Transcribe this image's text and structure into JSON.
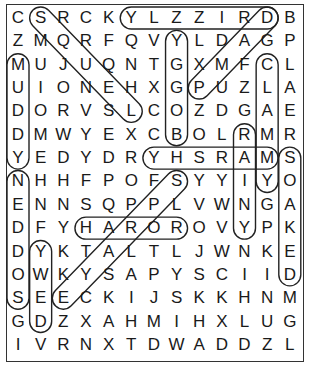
{
  "puzzle": {
    "type": "word-search",
    "rows": 15,
    "cols": 13,
    "grid": [
      [
        "C",
        "S",
        "R",
        "C",
        "K",
        "Y",
        "L",
        "Z",
        "Z",
        "I",
        "R",
        "D",
        "B"
      ],
      [
        "Z",
        "M",
        "Q",
        "R",
        "F",
        "Q",
        "V",
        "Y",
        "L",
        "D",
        "A",
        "G",
        "P"
      ],
      [
        "M",
        "U",
        "J",
        "U",
        "Q",
        "N",
        "T",
        "G",
        "X",
        "M",
        "F",
        "C",
        "L"
      ],
      [
        "U",
        "I",
        "O",
        "N",
        "E",
        "H",
        "X",
        "G",
        "P",
        "U",
        "Z",
        "L",
        "A"
      ],
      [
        "D",
        "O",
        "R",
        "V",
        "S",
        "L",
        "C",
        "O",
        "Z",
        "D",
        "G",
        "A",
        "E"
      ],
      [
        "D",
        "M",
        "W",
        "Y",
        "E",
        "X",
        "C",
        "B",
        "O",
        "L",
        "R",
        "M",
        "R"
      ],
      [
        "Y",
        "E",
        "D",
        "Y",
        "D",
        "R",
        "Y",
        "H",
        "S",
        "R",
        "A",
        "M",
        "S"
      ],
      [
        "N",
        "H",
        "H",
        "F",
        "P",
        "O",
        "F",
        "S",
        "Y",
        "Y",
        "I",
        "Y",
        "O"
      ],
      [
        "E",
        "N",
        "N",
        "S",
        "Q",
        "P",
        "P",
        "L",
        "V",
        "W",
        "N",
        "G",
        "A"
      ],
      [
        "D",
        "F",
        "Y",
        "H",
        "A",
        "R",
        "O",
        "R",
        "O",
        "V",
        "Y",
        "P",
        "K"
      ],
      [
        "D",
        "Y",
        "K",
        "T",
        "A",
        "L",
        "T",
        "L",
        "J",
        "W",
        "N",
        "K",
        "E"
      ],
      [
        "O",
        "W",
        "K",
        "Y",
        "S",
        "A",
        "P",
        "Y",
        "S",
        "C",
        "I",
        "I",
        "D"
      ],
      [
        "S",
        "E",
        "E",
        "C",
        "K",
        "I",
        "J",
        "S",
        "K",
        "K",
        "H",
        "N",
        "M"
      ],
      [
        "G",
        "D",
        "Z",
        "X",
        "A",
        "H",
        "M",
        "I",
        "H",
        "X",
        "L",
        "U",
        "G"
      ],
      [
        "I",
        "V",
        "R",
        "N",
        "X",
        "T",
        "D",
        "W",
        "A",
        "D",
        "D",
        "Z",
        "L"
      ]
    ],
    "found_words": [
      {
        "word": "DRIZZLY",
        "start": [
          0,
          11
        ],
        "end": [
          0,
          5
        ]
      },
      {
        "word": "DAMP",
        "start": [
          0,
          11
        ],
        "end": [
          3,
          8
        ]
      },
      {
        "word": "BOGGY",
        "start": [
          5,
          7
        ],
        "end": [
          1,
          7
        ]
      },
      {
        "word": "CLAMMY",
        "start": [
          2,
          11
        ],
        "end": [
          7,
          11
        ]
      },
      {
        "word": "MUDDY",
        "start": [
          2,
          0
        ],
        "end": [
          6,
          0
        ]
      },
      {
        "word": "MARSHY",
        "start": [
          6,
          11
        ],
        "end": [
          6,
          6
        ]
      },
      {
        "word": "RAINY",
        "start": [
          5,
          10
        ],
        "end": [
          9,
          10
        ]
      },
      {
        "word": "SOAKED",
        "start": [
          6,
          12
        ],
        "end": [
          11,
          12
        ]
      },
      {
        "word": "SODDEN",
        "start": [
          12,
          0
        ],
        "end": [
          7,
          0
        ]
      },
      {
        "word": "SLOPPY",
        "start": [
          7,
          7
        ],
        "end": [
          12,
          2
        ]
      },
      {
        "word": "SODDY",
        "start": [
          0,
          1
        ],
        "end": [
          4,
          5
        ]
      },
      {
        "word": "DEWY",
        "start": [
          13,
          1
        ],
        "end": [
          10,
          1
        ]
      },
      {
        "word": "HYDRO",
        "start": [
          9,
          3
        ],
        "end": [
          9,
          7
        ]
      }
    ],
    "loop_color": "#222222",
    "letter_color": "#1a1a1a"
  }
}
